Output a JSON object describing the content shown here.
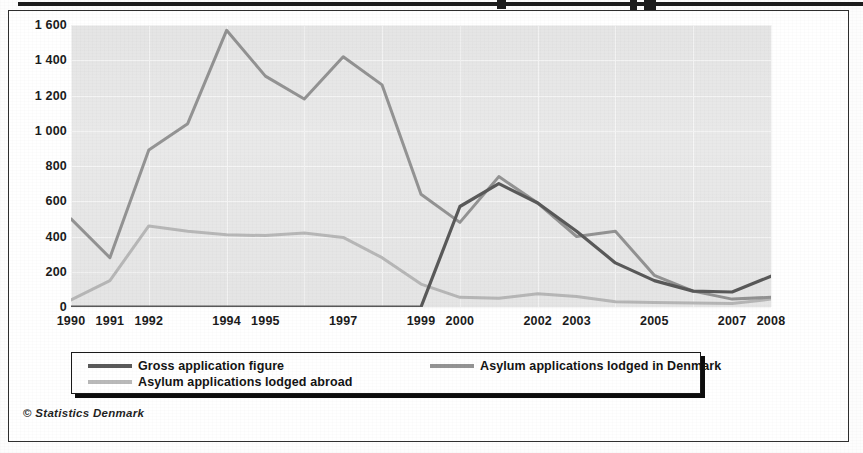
{
  "footer": {
    "credit_symbol": "©",
    "credit_text": "Statistics Denmark"
  },
  "legend": {
    "items": [
      {
        "label": "Gross application figure",
        "color": "#5a5a5a"
      },
      {
        "label": "Asylum applications lodged in Denmark",
        "color": "#949494"
      },
      {
        "label": "Asylum applications lodged  abroad",
        "color": "#b9b9b9"
      }
    ]
  },
  "chart_data": {
    "type": "line",
    "title": "",
    "subtitle": "",
    "xlabel": "",
    "ylabel": "",
    "grid": true,
    "legend_position": "bottom",
    "xlim": [
      1990,
      2008
    ],
    "ylim": [
      0,
      1600
    ],
    "yticks": [
      0,
      200,
      400,
      600,
      800,
      1000,
      1200,
      1400,
      1600
    ],
    "ytick_labels": [
      "0",
      "200",
      "400",
      "600",
      "800",
      "1 000",
      "1 200",
      "1 400",
      "1 600"
    ],
    "x": [
      1990,
      1991,
      1992,
      1993,
      1994,
      1995,
      1996,
      1997,
      1998,
      1999,
      2000,
      2001,
      2002,
      2003,
      2004,
      2005,
      2006,
      2007,
      2008
    ],
    "xtick_labels": [
      "1990",
      "1991",
      "1992",
      "",
      "1994",
      "1995",
      "",
      "1997",
      "",
      "1999",
      "2000",
      "",
      "2002",
      "2003",
      "",
      "2005",
      "",
      "2007",
      "2008"
    ],
    "series": [
      {
        "name": "Gross application figure",
        "color": "#5a5a5a",
        "values": [
          0,
          0,
          0,
          0,
          0,
          0,
          0,
          0,
          0,
          0,
          570,
          700,
          590,
          430,
          250,
          150,
          90,
          85,
          175
        ]
      },
      {
        "name": "Asylum applications lodged in Denmark",
        "color": "#949494",
        "values": [
          500,
          280,
          890,
          1040,
          1570,
          1310,
          1180,
          1420,
          1260,
          640,
          480,
          740,
          590,
          400,
          430,
          180,
          90,
          45,
          55
        ]
      },
      {
        "name": "Asylum applications lodged  abroad",
        "color": "#b9b9b9",
        "values": [
          40,
          150,
          460,
          430,
          410,
          405,
          420,
          395,
          280,
          130,
          55,
          50,
          75,
          60,
          30,
          25,
          22,
          20,
          45
        ]
      }
    ]
  },
  "ghost_text": {
    "top": "the scanned page verso",
    "right_1": "exhibi",
    "right_2": "s, melle",
    "right_3": "elsk, 2"
  }
}
